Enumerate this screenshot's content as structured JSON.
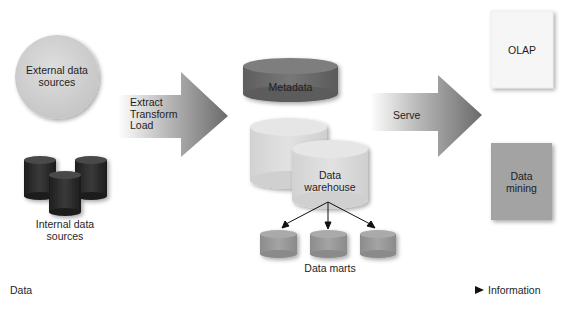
{
  "external_sources": {
    "line1": "External data",
    "line2": "sources"
  },
  "internal_sources": {
    "line1": "Internal data",
    "line2": "sources"
  },
  "etl_arrow": {
    "line1": "Extract",
    "line2": "Transform",
    "line3": "Load"
  },
  "metadata": {
    "label": "Metadata"
  },
  "warehouse": {
    "line1": "Data",
    "line2": "warehouse"
  },
  "data_marts": {
    "label": "Data marts"
  },
  "serve_arrow": {
    "label": "Serve"
  },
  "olap": {
    "label": "OLAP"
  },
  "data_mining": {
    "line1": "Data",
    "line2": "mining"
  },
  "axis": {
    "start": "Data",
    "end": "Information"
  },
  "colors": {
    "external_circle": "#d4d4d4",
    "internal_cylinders": "#2b2b2b",
    "metadata": "#6e6e6e",
    "warehouse": "#dcdcdc",
    "data_marts": "#9a9a9a",
    "arrow_dark": "#6a6a6a",
    "olap_box": "#f6f6f6",
    "mining_box": "#a3a3a3"
  }
}
